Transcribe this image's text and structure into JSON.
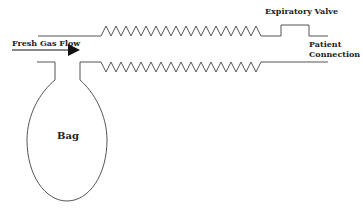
{
  "diagram": {
    "labels": {
      "fresh_gas_flow": "Fresh Gas Flow",
      "expiratory_valve": "Expiratory Valve",
      "patient_connection_line1": "Patient",
      "patient_connection_line2": "Connection",
      "bag": "Bag"
    },
    "colors": {
      "line": "#555555",
      "text": "#222222",
      "arrow": "#111111"
    }
  }
}
